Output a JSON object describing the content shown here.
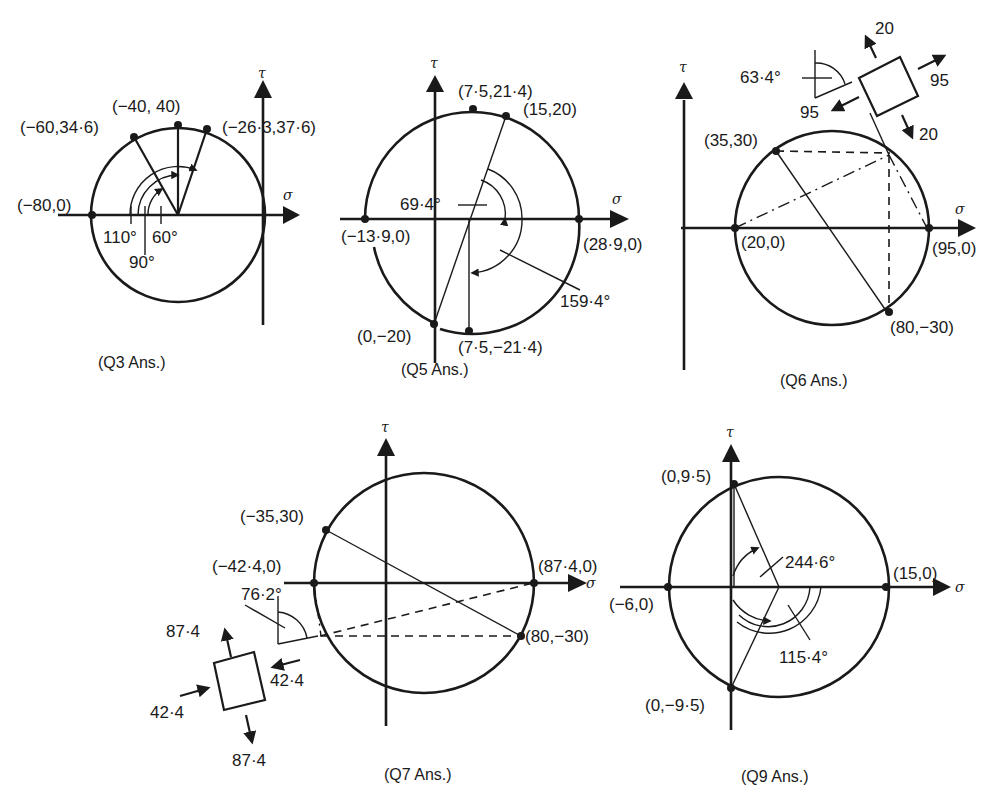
{
  "figure": {
    "axis_labels": {
      "sigma": "σ",
      "tau": "τ"
    },
    "panels": [
      {
        "id": "q3",
        "caption": "(Q3 Ans.)",
        "points": [
          "(−80,0)",
          "(−60,34·6)",
          "(−40, 40)",
          "(−26·3,37·6)"
        ],
        "angles": [
          "110°",
          "90°",
          "60°"
        ]
      },
      {
        "id": "q5",
        "caption": "(Q5 Ans.)",
        "points": [
          "(7·5,21·4)",
          "(15,20)",
          "(−13·9,0)",
          "(28·9,0)",
          "(0,−20)",
          "(7·5,−21·4)"
        ],
        "angles": [
          "69·4°",
          "159·4°"
        ]
      },
      {
        "id": "q6",
        "caption": "(Q6 Ans.)",
        "points": [
          "(35,30)",
          "(20,0)",
          "(95,0)",
          "(80,−30)"
        ],
        "angles": [
          "63·4°"
        ],
        "element_stresses": [
          "20",
          "95",
          "95",
          "20"
        ]
      },
      {
        "id": "q7",
        "caption": "(Q7 Ans.)",
        "points": [
          "(−35,30)",
          "(−42·4,0)",
          "(87·4,0)",
          "(80,−30)"
        ],
        "angles": [
          "76·2°"
        ],
        "element_stresses": [
          "87·4",
          "42·4",
          "42·4",
          "87·4"
        ]
      },
      {
        "id": "q9",
        "caption": "(Q9 Ans.)",
        "points": [
          "(0,9·5)",
          "(−6,0)",
          "(15,0)",
          "(0,−9·5)"
        ],
        "angles": [
          "244·6°",
          "115·4°"
        ]
      }
    ]
  }
}
